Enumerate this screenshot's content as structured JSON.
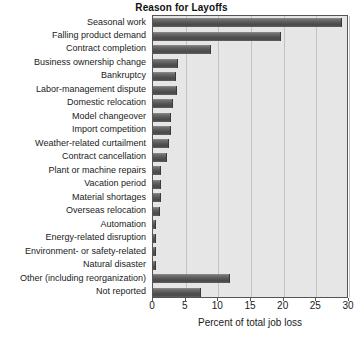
{
  "chart_data": {
    "type": "bar",
    "orientation": "horizontal",
    "title": "Reason for Layoffs",
    "xlabel": "Percent of total job loss",
    "ylabel": "",
    "xlim": [
      0,
      30
    ],
    "xticks": [
      0,
      5,
      10,
      15,
      20,
      25,
      30
    ],
    "grid": "vertical",
    "legend": "none",
    "bar_color": "#555555",
    "plot_background": "#e6e6e6",
    "categories": [
      "Seasonal work",
      "Falling product demand",
      "Contract completion",
      "Business ownership change",
      "Bankruptcy",
      "Labor-management dispute",
      "Domestic relocation",
      "Model changeover",
      "Import competition",
      "Weather-related curtailment",
      "Contract cancellation",
      "Plant or machine repairs",
      "Vacation period",
      "Material shortages",
      "Overseas relocation",
      "Automation",
      "Energy-related disruption",
      "Environment- or safety-related",
      "Natural disaster",
      "Other (including reorganization)",
      "Not reported"
    ],
    "values": [
      28.9,
      19.6,
      8.9,
      3.8,
      3.5,
      3.6,
      3.0,
      2.8,
      2.8,
      2.4,
      2.1,
      1.3,
      1.3,
      1.2,
      1.1,
      0.5,
      0.4,
      0.4,
      0.4,
      11.8,
      7.3
    ]
  }
}
